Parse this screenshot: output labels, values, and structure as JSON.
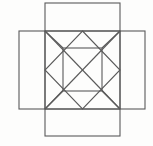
{
  "figure": {
    "background_color": "#fdfdfc",
    "stroke_color": "#5a5a5a",
    "stroke_width": 1.1,
    "canvas": {
      "width": 153,
      "height": 146
    }
  },
  "chart_data": {
    "type": "diagram",
    "units": "pixels",
    "xlim": [
      0,
      153
    ],
    "ylim": [
      0,
      146
    ],
    "grid": false,
    "legend": null,
    "shapes": [
      {
        "name": "center-square",
        "kind": "rect",
        "x": 45,
        "y": 31,
        "width": 75,
        "height": 78,
        "label": "center face"
      },
      {
        "name": "top-flap",
        "kind": "rect",
        "x": 45,
        "y": 3,
        "width": 75,
        "height": 28,
        "label": "top flap"
      },
      {
        "name": "bottom-flap",
        "kind": "rect",
        "x": 45,
        "y": 109,
        "width": 75,
        "height": 27,
        "label": "bottom flap"
      },
      {
        "name": "left-flap",
        "kind": "rect",
        "x": 19,
        "y": 31,
        "width": 26,
        "height": 78,
        "label": "left flap"
      },
      {
        "name": "right-flap",
        "kind": "rect",
        "x": 120,
        "y": 31,
        "width": 25,
        "height": 78,
        "label": "right flap"
      },
      {
        "name": "midpoint-diamond",
        "kind": "polygon",
        "points": "82.5,31 120,70 82.5,109 45,70",
        "label": "rotated square through side midpoints"
      },
      {
        "name": "inner-square",
        "kind": "rect",
        "x": 63,
        "y": 48,
        "width": 39,
        "height": 43,
        "label": "inner axis-aligned square"
      }
    ],
    "segments": [
      {
        "name": "diagonal-tl-br",
        "x1": 45,
        "y1": 31,
        "x2": 120,
        "y2": 109
      },
      {
        "name": "diagonal-tr-bl",
        "x1": 120,
        "y1": 31,
        "x2": 45,
        "y2": 109
      }
    ]
  }
}
